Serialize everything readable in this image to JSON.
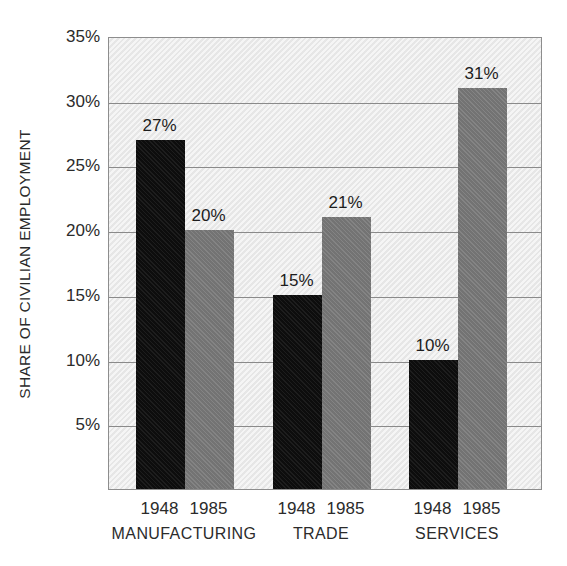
{
  "chart_data": {
    "type": "bar",
    "title": "",
    "subtitle": "",
    "xlabel": "",
    "ylabel": "SHARE OF CIVILIAN EMPLOYMENT",
    "categories": [
      "MANUFACTURING",
      "TRADE",
      "SERVICES"
    ],
    "series": [
      {
        "name": "1948",
        "values": [
          27,
          15,
          10
        ],
        "color": "#111111"
      },
      {
        "name": "1985",
        "values": [
          20,
          21,
          31
        ],
        "color": "#7c7c7c"
      }
    ],
    "value_labels": [
      [
        "27%",
        "20%"
      ],
      [
        "15%",
        "21%"
      ],
      [
        "10%",
        "31%"
      ]
    ],
    "ylim": [
      0,
      35
    ],
    "yticks": [
      5,
      10,
      15,
      20,
      25,
      30,
      35
    ],
    "ytick_labels": [
      "5%",
      "10%",
      "15%",
      "20%",
      "25%",
      "30%",
      "35%"
    ],
    "grid": true,
    "legend": "none",
    "plot_background": "#e9e9e9",
    "grid_color": "#8a8a8a",
    "border_color": "#8d8d8d",
    "page_background": "#ffffff"
  },
  "axis": {
    "y_title": "SHARE OF CIVILIAN EMPLOYMENT"
  },
  "groups": [
    {
      "category": "MANUFACTURING",
      "bars": [
        {
          "series": "1948",
          "value": 27,
          "label": "27%"
        },
        {
          "series": "1985",
          "value": 20,
          "label": "20%"
        }
      ]
    },
    {
      "category": "TRADE",
      "bars": [
        {
          "series": "1948",
          "value": 15,
          "label": "15%"
        },
        {
          "series": "1985",
          "value": 21,
          "label": "21%"
        }
      ]
    },
    {
      "category": "SERVICES",
      "bars": [
        {
          "series": "1948",
          "value": 10,
          "label": "10%"
        },
        {
          "series": "1985",
          "value": 31,
          "label": "31%"
        }
      ]
    }
  ]
}
